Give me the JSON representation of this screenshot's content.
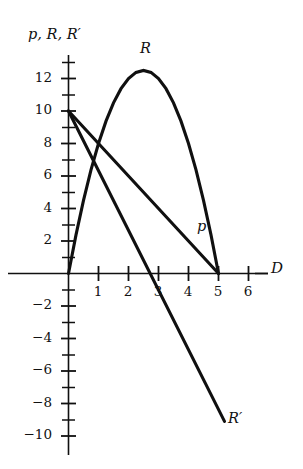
{
  "figure": {
    "y_axis_title": "p, R, R′",
    "x_axis_title": "D",
    "ink_color": "#101010"
  },
  "labels": {
    "revenue_curve": "R",
    "price_line": "p",
    "marginal_revenue_line": "R′"
  },
  "axes": {
    "y_tick_labels": [
      "12",
      "10",
      "8",
      "6",
      "4",
      "2",
      "−2",
      "−4",
      "−6",
      "−8",
      "−10"
    ],
    "x_tick_labels": [
      "1",
      "2",
      "3",
      "4",
      "5",
      "6"
    ]
  },
  "chart_data": {
    "type": "line",
    "title": "",
    "xlabel": "D",
    "ylabel": "p, R, R′",
    "xlim": [
      -0.25,
      6.9
    ],
    "ylim": [
      -10.8,
      13.8
    ],
    "x_major_ticks": [
      1,
      2,
      3,
      4,
      5,
      6
    ],
    "y_major_ticks": [
      12,
      10,
      8,
      6,
      4,
      2,
      -2,
      -4,
      -6,
      -8,
      -10
    ],
    "y_minor_tick_step": 1,
    "grid": false,
    "legend": "inline-labels",
    "series": [
      {
        "name": "R",
        "label": "R",
        "kind": "parabola",
        "equation": "R = 10D - 2D^2",
        "x": [
          0,
          0.25,
          0.5,
          0.75,
          1,
          1.25,
          1.5,
          1.75,
          2,
          2.25,
          2.5,
          2.75,
          3,
          3.25,
          3.5,
          3.75,
          4,
          4.25,
          4.5,
          4.75,
          5
        ],
        "values": [
          0,
          2.375,
          4.5,
          6.375,
          8,
          9.375,
          10.5,
          11.375,
          12,
          12.375,
          12.5,
          12.375,
          12,
          11.375,
          10.5,
          9.375,
          8,
          6.375,
          4.5,
          2.375,
          0
        ],
        "label_point": [
          2.6,
          13.6
        ],
        "vertex": [
          2.5,
          12.5
        ],
        "roots": [
          0,
          5
        ]
      },
      {
        "name": "p",
        "label": "p",
        "kind": "line",
        "equation": "p = 10 - 2D",
        "x": [
          0,
          5
        ],
        "values": [
          10,
          0
        ],
        "label_point": [
          4.5,
          2.8
        ],
        "intercepts": {
          "y": 10,
          "x": 5
        }
      },
      {
        "name": "R′",
        "label": "R′",
        "kind": "line",
        "equation": "R′ = 10 - 4D",
        "x": [
          0,
          5.2
        ],
        "values": [
          10,
          -9.1
        ],
        "label_point": [
          5.5,
          -8.4
        ],
        "intercepts": {
          "y": 10,
          "x": 2.5
        }
      }
    ]
  }
}
